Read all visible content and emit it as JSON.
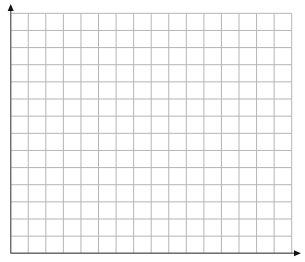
{
  "diagram": {
    "type": "blank-coordinate-grid",
    "columns": 16,
    "rows": 14,
    "origin": {
      "x": 10.7,
      "y": 253.3
    },
    "grid": {
      "left": 10.7,
      "right": 291.7,
      "top": 13.3,
      "bottom": 253.3
    },
    "axes": {
      "x_arrow_tip": {
        "x": 301,
        "y": 253.3
      },
      "y_arrow_tip": {
        "x": 10.7,
        "y": 4
      }
    },
    "colors": {
      "background": "#ffffff",
      "grid_line": "#b5b5b5",
      "axis_line": "#6e6e6e",
      "arrow": "#111111"
    },
    "labels": []
  }
}
